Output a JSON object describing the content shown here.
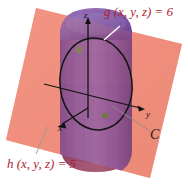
{
  "figure": {
    "background_color": "#ffffff",
    "width": 188,
    "height": 184
  },
  "labels": {
    "surface_g": "g (x, y, z) = 6",
    "plane_h": "h (x, y, z) = 5",
    "curve_c": "C"
  },
  "axes": {
    "z": "z",
    "x": "x",
    "y": "y"
  },
  "colors": {
    "plane": "#f0907e",
    "plane_dark": "#e8836f",
    "cylinder_upper": "#7d4fa0",
    "cylinder_upper_light": "#8f64ad",
    "cylinder_lower": "#9c4e6c",
    "cylinder_lower_dark": "#8a4160",
    "curve": "#141414",
    "axis": "#111111",
    "label_red": "#b01c2e",
    "label_black": "#1a1a1a",
    "leader": "#ffffff",
    "leader_gray": "#8c8c8c",
    "marker": "#7f8c3f"
  },
  "geometry": {
    "cylinder_axis_top_y": 30,
    "cylinder_axis_bottom_y": 150,
    "ellipse_center": [
      96,
      84
    ],
    "ellipse_rx": 36,
    "ellipse_ry": 46,
    "plane_corners": [
      [
        36,
        8
      ],
      [
        182,
        44
      ],
      [
        150,
        178
      ],
      [
        6,
        140
      ]
    ],
    "markers": [
      [
        79,
        50
      ],
      [
        105,
        116
      ]
    ]
  }
}
